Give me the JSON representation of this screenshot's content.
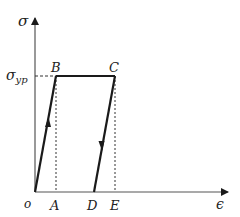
{
  "diagram": {
    "axes": {
      "y_label": "σ",
      "x_label": "ϵ",
      "origin_label": "o"
    },
    "yield_label_main": "σ",
    "yield_label_sub": "yp",
    "points": {
      "B": "B",
      "C": "C",
      "A": "A",
      "D": "D",
      "E": "E"
    },
    "colors": {
      "line": "#1a1a1a",
      "dashed": "#333333",
      "background": "#ffffff"
    }
  }
}
